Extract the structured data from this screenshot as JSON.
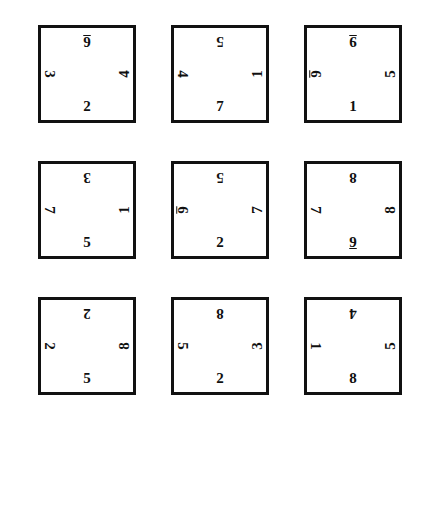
{
  "page": {
    "background_color": "#ffffff",
    "ink_color": "#101010",
    "border_color": "#111111"
  },
  "grid": {
    "rows": 3,
    "columns": 3,
    "square_count": 9
  },
  "squares": [
    {
      "id": "square-1",
      "row": 1,
      "column": 1,
      "numbers": {
        "top": {
          "value": "6",
          "marked": true
        },
        "left": {
          "value": "3",
          "marked": false
        },
        "right": {
          "value": "4",
          "marked": false
        },
        "bottom": {
          "value": "2",
          "marked": false
        }
      }
    },
    {
      "id": "square-2",
      "row": 1,
      "column": 2,
      "numbers": {
        "top": {
          "value": "5",
          "marked": false
        },
        "left": {
          "value": "4",
          "marked": false
        },
        "right": {
          "value": "1",
          "marked": false
        },
        "bottom": {
          "value": "7",
          "marked": false
        }
      }
    },
    {
      "id": "square-3",
      "row": 1,
      "column": 3,
      "numbers": {
        "top": {
          "value": "9",
          "marked": true
        },
        "left": {
          "value": "6",
          "marked": true
        },
        "right": {
          "value": "5",
          "marked": false
        },
        "bottom": {
          "value": "1",
          "marked": false
        }
      }
    },
    {
      "id": "square-4",
      "row": 2,
      "column": 1,
      "numbers": {
        "top": {
          "value": "3",
          "marked": false
        },
        "left": {
          "value": "7",
          "marked": false
        },
        "right": {
          "value": "1",
          "marked": false
        },
        "bottom": {
          "value": "5",
          "marked": false
        }
      }
    },
    {
      "id": "square-5",
      "row": 2,
      "column": 2,
      "numbers": {
        "top": {
          "value": "5",
          "marked": false
        },
        "left": {
          "value": "6",
          "marked": true
        },
        "right": {
          "value": "7",
          "marked": false
        },
        "bottom": {
          "value": "2",
          "marked": false
        }
      }
    },
    {
      "id": "square-6",
      "row": 2,
      "column": 3,
      "numbers": {
        "top": {
          "value": "8",
          "marked": false
        },
        "left": {
          "value": "7",
          "marked": false
        },
        "right": {
          "value": "8",
          "marked": false
        },
        "bottom": {
          "value": "9",
          "marked": true
        }
      }
    },
    {
      "id": "square-7",
      "row": 3,
      "column": 1,
      "numbers": {
        "top": {
          "value": "2",
          "marked": false
        },
        "left": {
          "value": "2",
          "marked": false
        },
        "right": {
          "value": "8",
          "marked": false
        },
        "bottom": {
          "value": "5",
          "marked": false
        }
      }
    },
    {
      "id": "square-8",
      "row": 3,
      "column": 2,
      "numbers": {
        "top": {
          "value": "8",
          "marked": false
        },
        "left": {
          "value": "5",
          "marked": false
        },
        "right": {
          "value": "3",
          "marked": false
        },
        "bottom": {
          "value": "2",
          "marked": false
        }
      }
    },
    {
      "id": "square-9",
      "row": 3,
      "column": 3,
      "numbers": {
        "top": {
          "value": "4",
          "marked": false
        },
        "left": {
          "value": "1",
          "marked": false
        },
        "right": {
          "value": "5",
          "marked": false
        },
        "bottom": {
          "value": "8",
          "marked": false
        }
      }
    }
  ]
}
